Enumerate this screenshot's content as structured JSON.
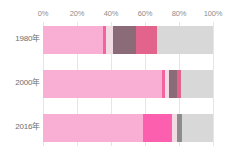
{
  "chart_data": {
    "type": "bar",
    "orientation": "horizontal",
    "stacked": true,
    "normalized": true,
    "title": "",
    "subtitle": "",
    "xlabel": "",
    "ylabel": "",
    "xlim": [
      0,
      100
    ],
    "grid": true,
    "legend": "none",
    "xticks": [
      "0%",
      "20%",
      "40%",
      "60%",
      "80%",
      "100%"
    ],
    "xtick_values": [
      0,
      20,
      40,
      60,
      80,
      100
    ],
    "categories": [
      "1980年",
      "2000年",
      "2016年"
    ],
    "series": [
      {
        "name": "segment-1",
        "color": "#f9aed4",
        "values": [
          35,
          70,
          59
        ]
      },
      {
        "name": "segment-2",
        "color": "#f4639e",
        "values": [
          2,
          2,
          17
        ]
      },
      {
        "name": "segment-3",
        "color": "#f2dce4",
        "values": [
          4,
          2,
          3
        ]
      },
      {
        "name": "segment-4",
        "color": "#8c6b78",
        "values": [
          14,
          5,
          3
        ]
      },
      {
        "name": "segment-5",
        "color": "#e2638c",
        "values": [
          12,
          2,
          0
        ]
      },
      {
        "name": "segment-6",
        "color": "#d8d8d8",
        "values": [
          33,
          19,
          18
        ]
      }
    ],
    "rows": [
      {
        "label": "1980年",
        "segments": [
          {
            "name": "segment-1",
            "value": 35,
            "color": "#f9aed4"
          },
          {
            "name": "segment-2",
            "value": 2,
            "color": "#f4639e"
          },
          {
            "name": "segment-3",
            "value": 4,
            "color": "#f2dce4"
          },
          {
            "name": "segment-4",
            "value": 14,
            "color": "#8c6b78"
          },
          {
            "name": "segment-5",
            "value": 12,
            "color": "#e2638c"
          },
          {
            "name": "segment-6",
            "value": 33,
            "color": "#d8d8d8"
          }
        ]
      },
      {
        "label": "2000年",
        "segments": [
          {
            "name": "segment-1",
            "value": 70,
            "color": "#f9aed4"
          },
          {
            "name": "segment-2",
            "value": 2,
            "color": "#f4639e"
          },
          {
            "name": "segment-3",
            "value": 2,
            "color": "#f2dce4"
          },
          {
            "name": "segment-4",
            "value": 5,
            "color": "#8c6b78"
          },
          {
            "name": "segment-5",
            "value": 2,
            "color": "#e2638c"
          },
          {
            "name": "segment-6",
            "value": 19,
            "color": "#d8d8d8"
          }
        ]
      },
      {
        "label": "2016年",
        "segments": [
          {
            "name": "segment-1",
            "value": 59,
            "color": "#f9aed4"
          },
          {
            "name": "segment-2",
            "value": 17,
            "color": "#fb5fae"
          },
          {
            "name": "segment-3",
            "value": 3,
            "color": "#f2dce4"
          },
          {
            "name": "segment-4",
            "value": 3,
            "color": "#8c8c8c"
          },
          {
            "name": "segment-6",
            "value": 18,
            "color": "#d8d8d8"
          }
        ]
      }
    ]
  },
  "colors": {
    "grid": "#e6e6e6",
    "tick_text": "#8d8d8d",
    "category_text": "#6e6e6e",
    "background": "#ffffff"
  }
}
